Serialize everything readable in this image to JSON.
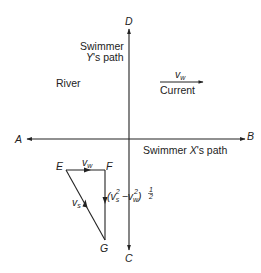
{
  "diagram": {
    "points": {
      "A": "A",
      "B": "B",
      "C": "C",
      "D": "D",
      "E": "E",
      "F": "F",
      "G": "G"
    },
    "labels": {
      "swimmer_y_line1": "Swimmer",
      "swimmer_y_line2": "Y's path",
      "river": "River",
      "current": "Current",
      "current_velocity": "v",
      "current_velocity_sub": "w",
      "swimmer_x_path": "Swimmer X's path",
      "ef_velocity": "v",
      "ef_velocity_sub": "w",
      "eg_velocity": "v",
      "eg_velocity_sub": "s",
      "fg_expression": "(v_s^2 - v_w^2)^(1/2)"
    },
    "fg_expression_parts": {
      "open": "(v",
      "s_sub": "s",
      "sup2a": "2",
      "minus": "−v",
      "w_sub": "w",
      "sup2b": "2",
      "close": ")",
      "exp_num": "1",
      "exp_den": "2"
    },
    "colors": {
      "line": "#222222",
      "background": "#ffffff"
    }
  }
}
